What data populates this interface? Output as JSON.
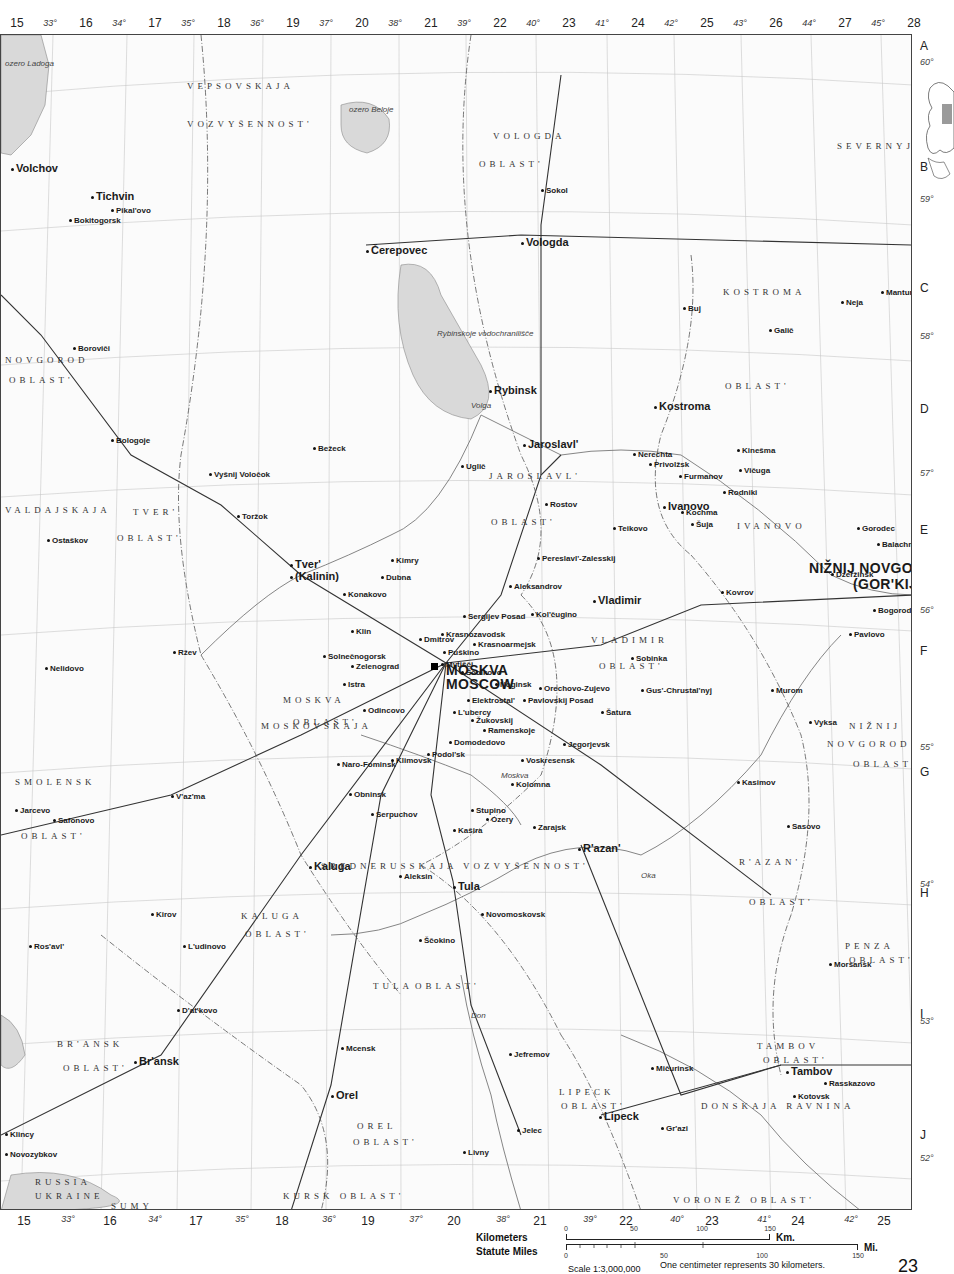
{
  "map": {
    "title": "Moscow Region",
    "page_number": "23",
    "scale": {
      "ratio_label": "Scale 1:3,000,000",
      "note": "One centimeter represents 30 kilometers.",
      "kilometers_label": "Kilometers",
      "kilometers_unit": "Km.",
      "kilometers_ticks": [
        "0",
        "50",
        "100",
        "150"
      ],
      "miles_label": "Statute Miles",
      "miles_unit": "Mi.",
      "miles_ticks": [
        "0",
        "50",
        "100",
        "150"
      ]
    },
    "top_grid": [
      "15",
      "16",
      "17",
      "18",
      "19",
      "20",
      "21",
      "22",
      "23",
      "24",
      "25",
      "26",
      "27",
      "28"
    ],
    "top_degrees": [
      "33°",
      "34°",
      "35°",
      "36°",
      "37°",
      "38°",
      "39°",
      "40°",
      "41°",
      "42°",
      "43°",
      "44°",
      "45°"
    ],
    "bottom_grid": [
      "15",
      "16",
      "17",
      "18",
      "19",
      "20",
      "21",
      "22",
      "23",
      "24",
      "25"
    ],
    "bottom_degrees": [
      "33°",
      "34°",
      "35°",
      "36°",
      "37°",
      "38°",
      "39°",
      "40°",
      "41°",
      "42°"
    ],
    "row_letters": [
      "A",
      "B",
      "C",
      "D",
      "E",
      "F",
      "G",
      "H",
      "I",
      "J"
    ],
    "latitudes": [
      "60°",
      "59°",
      "58°",
      "57°",
      "56°",
      "55°",
      "54°",
      "53°",
      "52°"
    ],
    "major_cities": [
      {
        "name": "MOSKVA",
        "x": 445,
        "y": 662
      },
      {
        "name": "MOSCOW",
        "x": 445,
        "y": 676
      },
      {
        "name": "NIŽNIJ NOVGOROD",
        "x": 808,
        "y": 560
      },
      {
        "name": "(GOR'KIJ)",
        "x": 852,
        "y": 576
      }
    ],
    "cities": [
      {
        "name": "Jaroslavl'",
        "x": 522,
        "y": 438
      },
      {
        "name": "Vologda",
        "x": 520,
        "y": 236
      },
      {
        "name": "Čerepovec",
        "x": 365,
        "y": 244
      },
      {
        "name": "Kostroma",
        "x": 653,
        "y": 400
      },
      {
        "name": "Ivanovo",
        "x": 662,
        "y": 500
      },
      {
        "name": "Tver'",
        "x": 289,
        "y": 558
      },
      {
        "name": "(Kalinin)",
        "x": 289,
        "y": 570
      },
      {
        "name": "Tula",
        "x": 452,
        "y": 880
      },
      {
        "name": "R'azan'",
        "x": 577,
        "y": 842
      },
      {
        "name": "Vladimir",
        "x": 592,
        "y": 594
      },
      {
        "name": "Br'ansk",
        "x": 133,
        "y": 1055
      },
      {
        "name": "Orel",
        "x": 330,
        "y": 1089
      },
      {
        "name": "Lipeck",
        "x": 598,
        "y": 1110
      },
      {
        "name": "Tambov",
        "x": 785,
        "y": 1065
      },
      {
        "name": "Kaluga",
        "x": 308,
        "y": 860
      },
      {
        "name": "Tichvin",
        "x": 90,
        "y": 190
      },
      {
        "name": "Volchov",
        "x": 10,
        "y": 162
      },
      {
        "name": "Rybinsk",
        "x": 488,
        "y": 384
      }
    ],
    "towns": [
      {
        "name": "Kimry",
        "x": 390,
        "y": 556
      },
      {
        "name": "Dubna",
        "x": 380,
        "y": 573
      },
      {
        "name": "Dmitrov",
        "x": 418,
        "y": 635
      },
      {
        "name": "Sergijev Posad",
        "x": 462,
        "y": 612
      },
      {
        "name": "Aleksandrov",
        "x": 508,
        "y": 582
      },
      {
        "name": "Puškino",
        "x": 442,
        "y": 648
      },
      {
        "name": "Mytišči",
        "x": 440,
        "y": 660
      },
      {
        "name": "Ščolkovo",
        "x": 460,
        "y": 668
      },
      {
        "name": "Noginsk",
        "x": 494,
        "y": 680
      },
      {
        "name": "Orechovo-Zujevo",
        "x": 538,
        "y": 684
      },
      {
        "name": "Elektrostal'",
        "x": 466,
        "y": 696
      },
      {
        "name": "L'ubercy",
        "x": 452,
        "y": 708
      },
      {
        "name": "Žukovskij",
        "x": 470,
        "y": 716
      },
      {
        "name": "Ramenskoje",
        "x": 482,
        "y": 726
      },
      {
        "name": "Domodedovo",
        "x": 448,
        "y": 738
      },
      {
        "name": "Podol'sk",
        "x": 426,
        "y": 750
      },
      {
        "name": "Klimovsk",
        "x": 390,
        "y": 756
      },
      {
        "name": "Kolomna",
        "x": 510,
        "y": 780
      },
      {
        "name": "Voskresensk",
        "x": 520,
        "y": 756
      },
      {
        "name": "Jegorjevsk",
        "x": 562,
        "y": 740
      },
      {
        "name": "Serpuchov",
        "x": 370,
        "y": 810
      },
      {
        "name": "Stupino",
        "x": 470,
        "y": 806
      },
      {
        "name": "Kašira",
        "x": 452,
        "y": 826
      },
      {
        "name": "Ozery",
        "x": 485,
        "y": 815
      },
      {
        "name": "Zarajsk",
        "x": 532,
        "y": 823
      },
      {
        "name": "Aleksin",
        "x": 398,
        "y": 872
      },
      {
        "name": "Novomoskovsk",
        "x": 480,
        "y": 910
      },
      {
        "name": "Ščokino",
        "x": 418,
        "y": 936
      },
      {
        "name": "Klin",
        "x": 350,
        "y": 627
      },
      {
        "name": "Zelenograd",
        "x": 350,
        "y": 662
      },
      {
        "name": "Istra",
        "x": 342,
        "y": 680
      },
      {
        "name": "Odincovo",
        "x": 362,
        "y": 706
      },
      {
        "name": "Konakovo",
        "x": 342,
        "y": 590
      },
      {
        "name": "Solnečnogorsk",
        "x": 322,
        "y": 652
      },
      {
        "name": "Obninsk",
        "x": 348,
        "y": 790
      },
      {
        "name": "Naro-Fominsk",
        "x": 336,
        "y": 760
      },
      {
        "name": "Mcensk",
        "x": 340,
        "y": 1044
      },
      {
        "name": "Livny",
        "x": 462,
        "y": 1148
      },
      {
        "name": "Jelec",
        "x": 516,
        "y": 1126
      },
      {
        "name": "Jefremov",
        "x": 508,
        "y": 1050
      },
      {
        "name": "Mičurinsk",
        "x": 650,
        "y": 1064
      },
      {
        "name": "Gr'azi",
        "x": 660,
        "y": 1124
      },
      {
        "name": "Kotovsk",
        "x": 792,
        "y": 1092
      },
      {
        "name": "Rasskazovo",
        "x": 823,
        "y": 1079
      },
      {
        "name": "Moršansk",
        "x": 828,
        "y": 960
      },
      {
        "name": "Kasimov",
        "x": 736,
        "y": 778
      },
      {
        "name": "Murom",
        "x": 770,
        "y": 686
      },
      {
        "name": "Vyksa",
        "x": 808,
        "y": 718
      },
      {
        "name": "Kovrov",
        "x": 720,
        "y": 588
      },
      {
        "name": "Dzeržinsk",
        "x": 830,
        "y": 570
      },
      {
        "name": "Balachna",
        "x": 876,
        "y": 540
      },
      {
        "name": "Gorodec",
        "x": 856,
        "y": 524
      },
      {
        "name": "Bogorodsk",
        "x": 872,
        "y": 606
      },
      {
        "name": "Pavlovo",
        "x": 848,
        "y": 630
      },
      {
        "name": "Kinešma",
        "x": 736,
        "y": 446
      },
      {
        "name": "Vičuga",
        "x": 738,
        "y": 466
      },
      {
        "name": "Nerechta",
        "x": 632,
        "y": 450
      },
      {
        "name": "Furmanov",
        "x": 678,
        "y": 472
      },
      {
        "name": "Rostov",
        "x": 544,
        "y": 500
      },
      {
        "name": "Pereslavl'-Zalesskij",
        "x": 536,
        "y": 554
      },
      {
        "name": "Uglič",
        "x": 460,
        "y": 462
      },
      {
        "name": "Bežeck",
        "x": 312,
        "y": 444
      },
      {
        "name": "Vyšnij Voločok",
        "x": 208,
        "y": 470
      },
      {
        "name": "Toržok",
        "x": 236,
        "y": 512
      },
      {
        "name": "Ržev",
        "x": 172,
        "y": 648
      },
      {
        "name": "V'az'ma",
        "x": 170,
        "y": 792
      },
      {
        "name": "Safonovo",
        "x": 52,
        "y": 816
      },
      {
        "name": "Jarcevo",
        "x": 14,
        "y": 806
      },
      {
        "name": "Nelidovo",
        "x": 44,
        "y": 664
      },
      {
        "name": "Ostaškov",
        "x": 46,
        "y": 536
      },
      {
        "name": "Bologoje",
        "x": 110,
        "y": 436
      },
      {
        "name": "Boroviči",
        "x": 72,
        "y": 344
      },
      {
        "name": "Bokitogorsk",
        "x": 68,
        "y": 216
      },
      {
        "name": "Pikal'ovo",
        "x": 110,
        "y": 206
      },
      {
        "name": "Sokol",
        "x": 540,
        "y": 186
      },
      {
        "name": "Galič",
        "x": 768,
        "y": 326
      },
      {
        "name": "Buj",
        "x": 682,
        "y": 304
      },
      {
        "name": "Manturovo",
        "x": 880,
        "y": 288
      },
      {
        "name": "Neja",
        "x": 840,
        "y": 298
      },
      {
        "name": "Kirov",
        "x": 150,
        "y": 910
      },
      {
        "name": "L'udinovo",
        "x": 182,
        "y": 942
      },
      {
        "name": "Ros'avl'",
        "x": 28,
        "y": 942
      },
      {
        "name": "D'at'kovo",
        "x": 176,
        "y": 1006
      },
      {
        "name": "Klincy",
        "x": 4,
        "y": 1130
      },
      {
        "name": "Novozybkov",
        "x": 4,
        "y": 1150
      },
      {
        "name": "Gus'-Chrustal'nyj",
        "x": 640,
        "y": 686
      },
      {
        "name": "Kol'čugino",
        "x": 530,
        "y": 610
      },
      {
        "name": "Sobinka",
        "x": 630,
        "y": 654
      },
      {
        "name": "Pavlovskij Posad",
        "x": 522,
        "y": 696
      },
      {
        "name": "Šatura",
        "x": 600,
        "y": 708
      },
      {
        "name": "Krasnoarmejsk",
        "x": 472,
        "y": 640
      },
      {
        "name": "Krasnozavodsk",
        "x": 440,
        "y": 630
      },
      {
        "name": "Sasovo",
        "x": 786,
        "y": 822
      },
      {
        "name": "Rodniki",
        "x": 722,
        "y": 488
      },
      {
        "name": "Šuja",
        "x": 690,
        "y": 520
      },
      {
        "name": "Teikovo",
        "x": 612,
        "y": 524
      },
      {
        "name": "Kochma",
        "x": 680,
        "y": 508
      },
      {
        "name": "Privolžsk",
        "x": 648,
        "y": 460
      }
    ],
    "regions": [
      {
        "name": "VEPSOVSKAJA",
        "x": 186,
        "y": 80
      },
      {
        "name": "VOZVYŠENNOST'",
        "x": 186,
        "y": 118
      },
      {
        "name": "VOLOGDA",
        "x": 492,
        "y": 130
      },
      {
        "name": "OBLAST'",
        "x": 478,
        "y": 158
      },
      {
        "name": "KOSTROMA",
        "x": 722,
        "y": 286
      },
      {
        "name": "OBLAST'",
        "x": 724,
        "y": 380
      },
      {
        "name": "JAROSLAVL'",
        "x": 488,
        "y": 470
      },
      {
        "name": "OBLAST'",
        "x": 490,
        "y": 516
      },
      {
        "name": "IVANOVO",
        "x": 736,
        "y": 520
      },
      {
        "name": "NOVGOROD",
        "x": 4,
        "y": 354
      },
      {
        "name": "OBLAST'",
        "x": 8,
        "y": 374
      },
      {
        "name": "TVER'",
        "x": 132,
        "y": 506
      },
      {
        "name": "OBLAST'",
        "x": 116,
        "y": 532
      },
      {
        "name": "MOSKVA",
        "x": 282,
        "y": 694
      },
      {
        "name": "OBLAST'",
        "x": 292,
        "y": 716
      },
      {
        "name": "VLADIMIR",
        "x": 590,
        "y": 634
      },
      {
        "name": "OBLAST'",
        "x": 598,
        "y": 660
      },
      {
        "name": "SMOLENSK",
        "x": 14,
        "y": 776
      },
      {
        "name": "OBLAST'",
        "x": 20,
        "y": 830
      },
      {
        "name": "KALUGA",
        "x": 240,
        "y": 910
      },
      {
        "name": "OBLAST'",
        "x": 244,
        "y": 928
      },
      {
        "name": "TULA",
        "x": 372,
        "y": 980
      },
      {
        "name": "OBLAST'",
        "x": 414,
        "y": 980
      },
      {
        "name": "R'AZAN'",
        "x": 738,
        "y": 856
      },
      {
        "name": "OBLAST'",
        "x": 748,
        "y": 896
      },
      {
        "name": "NIŽNIJ",
        "x": 848,
        "y": 720
      },
      {
        "name": "NOVGOROD",
        "x": 826,
        "y": 738
      },
      {
        "name": "OBLAST'",
        "x": 852,
        "y": 758
      },
      {
        "name": "BR'ANSK",
        "x": 56,
        "y": 1038
      },
      {
        "name": "OBLAST'",
        "x": 62,
        "y": 1062
      },
      {
        "name": "OREL",
        "x": 356,
        "y": 1120
      },
      {
        "name": "OBLAST'",
        "x": 352,
        "y": 1136
      },
      {
        "name": "LIPECK",
        "x": 558,
        "y": 1086
      },
      {
        "name": "OBLAST'",
        "x": 560,
        "y": 1100
      },
      {
        "name": "TAMBOV",
        "x": 756,
        "y": 1040
      },
      {
        "name": "OBLAST'",
        "x": 762,
        "y": 1054
      },
      {
        "name": "PENZA",
        "x": 844,
        "y": 940
      },
      {
        "name": "OBLAST'",
        "x": 848,
        "y": 954
      },
      {
        "name": "KURSK OBLAST'",
        "x": 282,
        "y": 1190
      },
      {
        "name": "VORONEŽ OBLAST'",
        "x": 672,
        "y": 1194
      },
      {
        "name": "SUMY",
        "x": 110,
        "y": 1200
      },
      {
        "name": "UKRAINE",
        "x": 34,
        "y": 1190
      },
      {
        "name": "RUSSIA",
        "x": 34,
        "y": 1176
      },
      {
        "name": "SREDNERUSSKAJA VOZVYŠENNOST'",
        "x": 320,
        "y": 860
      },
      {
        "name": "DONSKAJA RAVNINA",
        "x": 700,
        "y": 1100
      },
      {
        "name": "SEVERNYJE UVALY",
        "x": 836,
        "y": 140
      },
      {
        "name": "VALDAJSKAJA",
        "x": 4,
        "y": 504
      },
      {
        "name": "MOSKOVSKAJA",
        "x": 260,
        "y": 720
      }
    ],
    "water": [
      {
        "name": "ozero Ladoga",
        "x": 4,
        "y": 58
      },
      {
        "name": "ozero Beloje",
        "x": 348,
        "y": 104
      },
      {
        "name": "Rybinskoje vodochranilišče",
        "x": 436,
        "y": 328
      },
      {
        "name": "Volga",
        "x": 470,
        "y": 400
      },
      {
        "name": "Oka",
        "x": 640,
        "y": 870
      },
      {
        "name": "Don",
        "x": 470,
        "y": 1010
      },
      {
        "name": "Moskva",
        "x": 500,
        "y": 770
      }
    ],
    "inset_label": "Europe locator"
  }
}
